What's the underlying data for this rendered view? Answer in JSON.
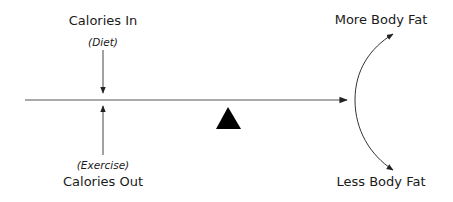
{
  "diagram": {
    "input_top": {
      "title": "Calories In",
      "subtitle": "(Diet)"
    },
    "input_bottom": {
      "title": "Calories Out",
      "subtitle": "(Exercise)"
    },
    "outcome_top": "More Body Fat",
    "outcome_bottom": "Less Body Fat",
    "icons": {
      "fulcrum": "triangle-icon",
      "balance_line": "arrow-right-icon",
      "outcome_arc": "curved-double-arrow-icon"
    },
    "colors": {
      "line": "#555555",
      "fulcrum": "#000000",
      "text": "#1a1a1a"
    }
  }
}
